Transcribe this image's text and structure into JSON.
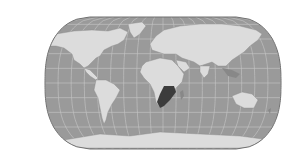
{
  "map": {
    "projection": "Equal Earth",
    "colors": {
      "background": "#ffffff",
      "ocean": "#9a9a9a",
      "land": "#dcdcdc",
      "land_dark": "#888888",
      "highlight": "#3c3c3c",
      "graticule": "#c8c8c8",
      "outline": "#707070"
    },
    "highlighted_region": "Southern Africa",
    "graticule": {
      "lon_step_deg": 20,
      "lat_step_deg": 20
    }
  }
}
